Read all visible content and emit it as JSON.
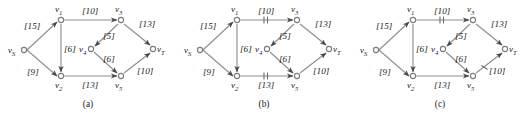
{
  "figure": {
    "type": "network-flow-diagram-set",
    "panel_count": 3,
    "colors": {
      "edge": "#8f8f8f",
      "node_stroke": "#7a7a7a",
      "node_fill": "#ffffff",
      "arrow": "#4a4a4a",
      "text": "#1a1a1a",
      "background": "#ffffff"
    }
  },
  "nodes": {
    "vS": {
      "label": "v",
      "sub": "S"
    },
    "v1": {
      "label": "v",
      "sub": "1"
    },
    "v2": {
      "label": "v",
      "sub": "2"
    },
    "v3": {
      "label": "v",
      "sub": "3"
    },
    "v4": {
      "label": "v",
      "sub": "4"
    },
    "v5": {
      "label": "v",
      "sub": "5"
    },
    "vT": {
      "label": "v",
      "sub": "T"
    }
  },
  "edges": {
    "vS_v1": {
      "capacity": "[15]",
      "from": "vS",
      "to": "v1"
    },
    "vS_v2": {
      "capacity": "[9]",
      "from": "vS",
      "to": "v2"
    },
    "v1_v2": {
      "capacity": "[6]",
      "from": "v1",
      "to": "v2"
    },
    "v1_v3": {
      "capacity": "[10]",
      "from": "v1",
      "to": "v3"
    },
    "v2_v5": {
      "capacity": "[13]",
      "from": "v2",
      "to": "v5"
    },
    "v3_v4": {
      "capacity": "[5]",
      "from": "v3",
      "to": "v4"
    },
    "v3_vT": {
      "capacity": "[13]",
      "from": "v3",
      "to": "vT"
    },
    "v4_v5": {
      "capacity": "[6]",
      "from": "v4",
      "to": "v5"
    },
    "v5_vT": {
      "capacity": "[10]",
      "from": "v5",
      "to": "vT"
    }
  },
  "panels": [
    {
      "id": "a",
      "caption": "(a)",
      "marked_edges": []
    },
    {
      "id": "b",
      "caption": "(b)",
      "marked_edges": [
        "v1_v3",
        "v2_v5"
      ]
    },
    {
      "id": "c",
      "caption": "(c)",
      "marked_edges": [
        "v1_v3",
        "v5_vT"
      ]
    }
  ]
}
